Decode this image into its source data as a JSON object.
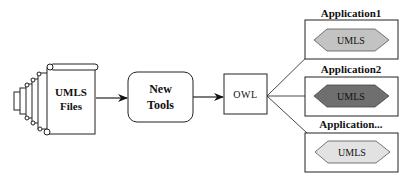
{
  "diagram": {
    "source": {
      "label_line1": "UMLS",
      "label_line2": "Files",
      "icon": "scroll-stack-icon"
    },
    "process": {
      "label_line1": "New",
      "label_line2": "Tools"
    },
    "format": {
      "label": "OWL"
    },
    "applications": [
      {
        "title": "Application1",
        "hex_label": "UMLS",
        "hex_color": "#c3c3c3"
      },
      {
        "title": "Application2",
        "hex_label": "UMLS",
        "hex_color": "#6f6f6f"
      },
      {
        "title": "Application...",
        "hex_label": "UMLS",
        "hex_color": "#e2e2e2"
      }
    ],
    "edges": [
      {
        "from": "UMLS Files",
        "to": "New Tools"
      },
      {
        "from": "New Tools",
        "to": "OWL"
      },
      {
        "from": "OWL",
        "to": "Application1"
      },
      {
        "from": "OWL",
        "to": "Application2"
      },
      {
        "from": "OWL",
        "to": "Application..."
      }
    ],
    "colors": {
      "stroke": "#222222",
      "background": "#ffffff"
    }
  }
}
